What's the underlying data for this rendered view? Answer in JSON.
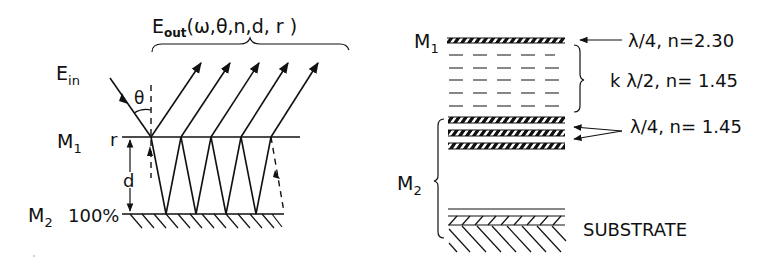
{
  "left_panel": {
    "output_label_main": "E",
    "output_label_sub": "out",
    "output_label_args": "(ω,θ,n,d, r )",
    "input_label_main": "E",
    "input_label_sub": "in",
    "angle_label": "θ",
    "mirror1_label": "M",
    "mirror1_sub": "1",
    "mirror1_reflectivity": "r",
    "mirror2_label": "M",
    "mirror2_sub": "2",
    "mirror2_reflectivity": "100%",
    "gap_label": "d"
  },
  "right_panel": {
    "mirror1_label": "M",
    "mirror1_sub": "1",
    "mirror2_label": "M",
    "mirror2_sub": "2",
    "layer_top": "λ/4, n=2.30",
    "spacer": "k λ/2, n= 1.45",
    "stack_layers": "λ/4, n= 1.45",
    "substrate": "SUBSTRATE"
  },
  "colors": {
    "ink": "#111111",
    "background": "#ffffff"
  }
}
